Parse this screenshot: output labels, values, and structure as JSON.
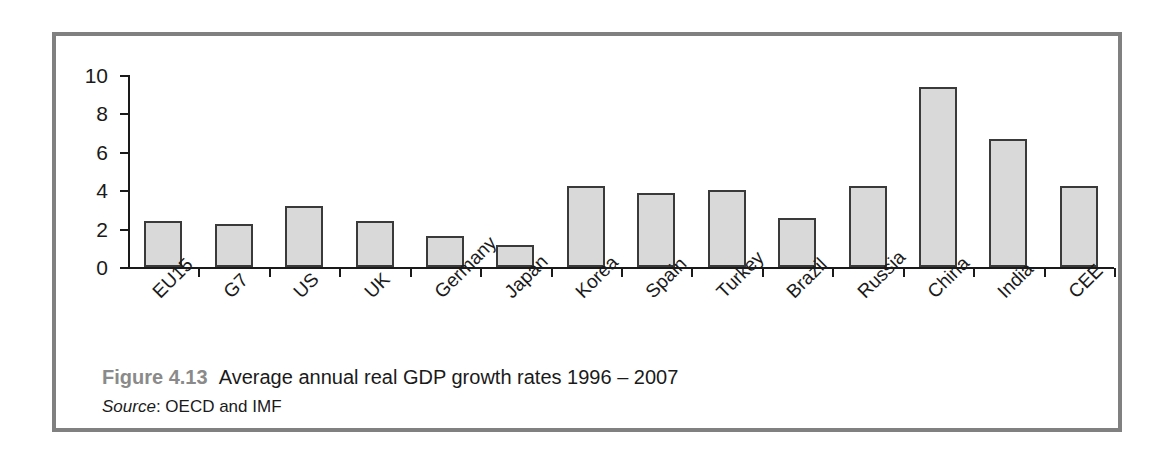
{
  "figure": {
    "number_label": "Figure 4.13",
    "title": "Average annual real GDP growth rates 1996 – 2007",
    "source_word": "Source",
    "source_text": ": OECD and IMF",
    "frame_color": "#808080",
    "number_color": "#8a8a8a"
  },
  "chart_data": {
    "type": "bar",
    "title": "Average annual real GDP growth rates 1996 – 2007",
    "xlabel": "",
    "ylabel": "",
    "ylim": [
      0,
      10
    ],
    "yticks": [
      0,
      2,
      4,
      6,
      8,
      10
    ],
    "grid": false,
    "legend": null,
    "bar_fill_color": "#d9d9d9",
    "bar_edge_color": "#3a3a3a",
    "categories": [
      "EU15",
      "G7",
      "US",
      "UK",
      "Germany",
      "Japan",
      "Korea",
      "Spain",
      "Turkey",
      "Brazil",
      "Russia",
      "China",
      "India",
      "CEE"
    ],
    "values": [
      2.4,
      2.25,
      3.2,
      2.4,
      1.6,
      1.15,
      4.2,
      3.85,
      4.0,
      2.55,
      4.2,
      9.35,
      6.65,
      4.2
    ]
  }
}
